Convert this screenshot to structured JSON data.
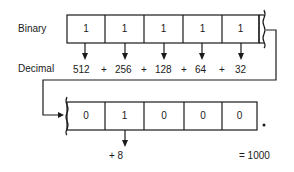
{
  "labels": {
    "binary": "Binary",
    "decimal": "Decimal"
  },
  "top_row": {
    "bits": [
      "1",
      "1",
      "1",
      "1",
      "1"
    ],
    "decimal_terms": [
      "512",
      "+",
      "256",
      "+",
      "128",
      "+",
      "64",
      "+",
      "32"
    ]
  },
  "bottom_row": {
    "bits": [
      "0",
      "1",
      "0",
      "0",
      "0"
    ],
    "decimal_terms": [
      "+ 8"
    ],
    "result": "= 1000",
    "point": "."
  }
}
